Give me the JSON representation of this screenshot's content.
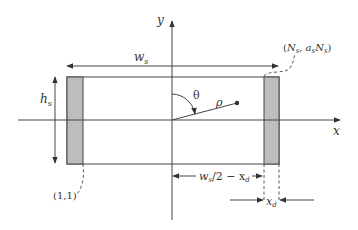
{
  "diagram": {
    "axes": {
      "x_label": "x",
      "y_label": "y"
    },
    "dimensions": {
      "width_label_main": "w",
      "width_label_sub": "s",
      "height_label_main": "h",
      "height_label_sub": "s",
      "inner_distance_main": "w",
      "inner_distance_sub": "s",
      "inner_distance_rest": "/2 − x",
      "inner_distance_rest_sub": "d",
      "detector_width_main": "x",
      "detector_width_sub": "d"
    },
    "polar": {
      "angle_label": "θ",
      "radius_label": "ρ"
    },
    "corner_labels": {
      "bottom_left": "(1,1)",
      "top_right_open": "(",
      "top_right_N1": "N",
      "top_right_N1_sub": "s",
      "top_right_comma": ", ",
      "top_right_a": "a",
      "top_right_a_sub": "s",
      "top_right_N2": "N",
      "top_right_N2_sub": "s",
      "top_right_close": ")"
    },
    "colors": {
      "line": "#444444",
      "detector_fill": "#bdbdbd",
      "background": "#ffffff"
    }
  }
}
